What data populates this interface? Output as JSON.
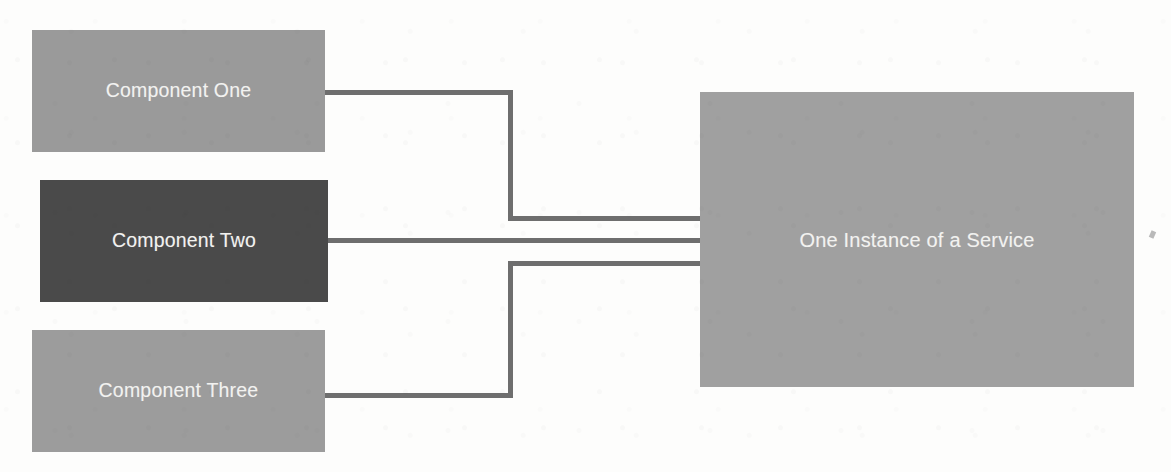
{
  "diagram": {
    "background_color": "#fdfdfc",
    "edge_color": "#6e6e6e",
    "label_color": "#f2f2f0",
    "nodes": [
      {
        "id": "component-one",
        "label": "Component One",
        "fill": "#9a9a9a",
        "x": 32,
        "y": 30,
        "width": 293,
        "height": 122
      },
      {
        "id": "component-two",
        "label": "Component Two",
        "fill": "#4a4a4a",
        "x": 40,
        "y": 180,
        "width": 288,
        "height": 122
      },
      {
        "id": "component-three",
        "label": "Component Three",
        "fill": "#9c9c9c",
        "x": 32,
        "y": 330,
        "width": 293,
        "height": 122
      },
      {
        "id": "service",
        "label": "One Instance of a Service",
        "fill": "#a0a0a0",
        "x": 700,
        "y": 92,
        "width": 434,
        "height": 295
      }
    ],
    "edges": [
      {
        "id": "edge-one",
        "from": "component-one",
        "to": "service",
        "style": "orthogonal",
        "points": [
          [
            325,
            92
          ],
          [
            508,
            92
          ],
          [
            508,
            218
          ],
          [
            700,
            218
          ]
        ]
      },
      {
        "id": "edge-two",
        "from": "component-two",
        "to": "service",
        "style": "straight",
        "points": [
          [
            328,
            240
          ],
          [
            700,
            240
          ]
        ]
      },
      {
        "id": "edge-three",
        "from": "component-three",
        "to": "service",
        "style": "orthogonal",
        "points": [
          [
            325,
            395
          ],
          [
            508,
            395
          ],
          [
            508,
            263
          ],
          [
            700,
            263
          ]
        ]
      }
    ]
  }
}
